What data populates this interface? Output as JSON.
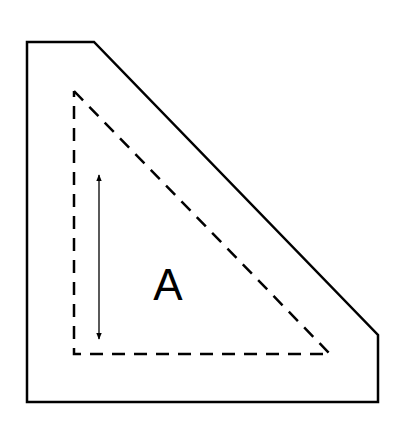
{
  "diagram": {
    "label": "A",
    "colors": {
      "stroke": "#000000",
      "background": "#ffffff"
    },
    "outer_shape": {
      "points": [
        [
          27,
          42
        ],
        [
          94,
          42
        ],
        [
          378,
          335
        ],
        [
          378,
          402
        ],
        [
          27,
          402
        ]
      ],
      "style": "solid"
    },
    "inner_triangle": {
      "points": [
        [
          74,
          91
        ],
        [
          330,
          354
        ],
        [
          74,
          354
        ]
      ],
      "style": "dashed"
    },
    "dimension_arrow": {
      "x": 99,
      "y1": 173,
      "y2": 341,
      "type": "double-headed"
    }
  }
}
